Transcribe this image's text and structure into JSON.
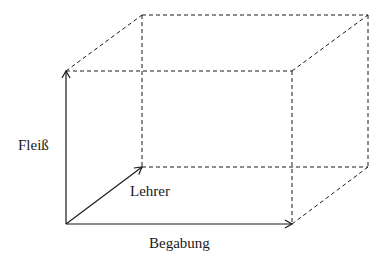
{
  "diagram": {
    "type": "3d-axes-cube",
    "axes": {
      "vertical": {
        "label": "Fleiß"
      },
      "horizontal": {
        "label": "Begabung"
      },
      "depth": {
        "label": "Lehrer"
      }
    },
    "colors": {
      "line": "#1a1a1a",
      "background": "#ffffff"
    }
  }
}
